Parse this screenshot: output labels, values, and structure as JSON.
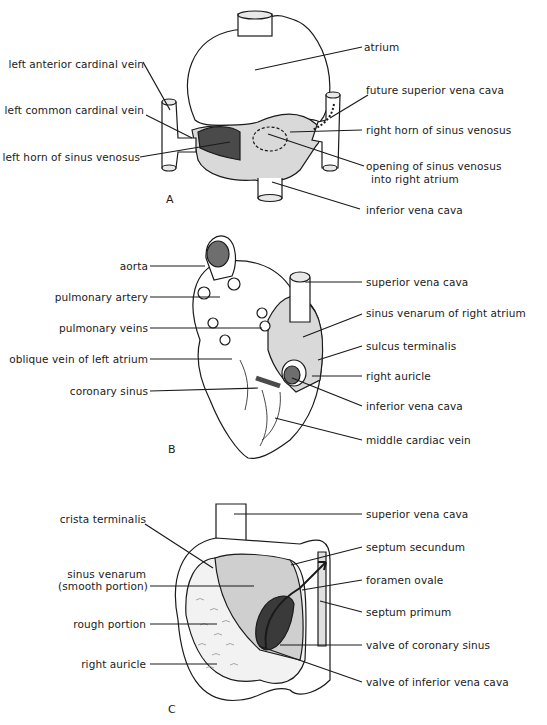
{
  "panels": [
    {
      "id": "A",
      "letter": "A",
      "labels_left": [
        "left anterior cardinal vein",
        "left common cardinal vein",
        "left horn of sinus venosus"
      ],
      "labels_right": [
        "atrium",
        "future superior vena cava",
        "right horn of sinus venosus",
        "opening of sinus venosus",
        "into right atrium",
        "inferior vena cava"
      ]
    },
    {
      "id": "B",
      "letter": "B",
      "labels_left": [
        "aorta",
        "pulmonary artery",
        "pulmonary veins",
        "oblique vein of left atrium",
        "coronary sinus"
      ],
      "labels_right": [
        "superior vena cava",
        "sinus venarum of right atrium",
        "sulcus terminalis",
        "right auricle",
        "inferior vena cava",
        "middle cardiac vein"
      ]
    },
    {
      "id": "C",
      "letter": "C",
      "labels_left": [
        "crista terminalis",
        "sinus venarum",
        "(smooth portion)",
        "rough portion",
        "right auricle"
      ],
      "labels_right": [
        "superior vena cava",
        "septum secundum",
        "foramen ovale",
        "septum primum",
        "valve of coronary sinus",
        "valve of inferior vena cava"
      ]
    }
  ],
  "colors": {
    "line": "#1a1a1a",
    "sinus_light": "#d9d9d9",
    "sinus_dark": "#4a4a4a",
    "background": "#ffffff"
  }
}
